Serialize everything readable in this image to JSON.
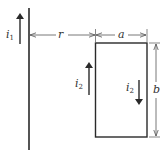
{
  "diagram": {
    "title": "",
    "wire": {
      "current_label": "i",
      "current_subscript": "1",
      "current_direction": "up"
    },
    "loop": {
      "left_side": {
        "current_label": "i",
        "current_subscript": "2",
        "current_direction": "up"
      },
      "right_side": {
        "current_label": "i",
        "current_subscript": "2",
        "current_direction": "down"
      }
    },
    "dimensions": {
      "distance_label": "r",
      "width_label": "a",
      "height_label": "b"
    },
    "colors": {
      "line": "#2a2a2a",
      "dimension": "#555555",
      "background": "#ffffff"
    }
  }
}
